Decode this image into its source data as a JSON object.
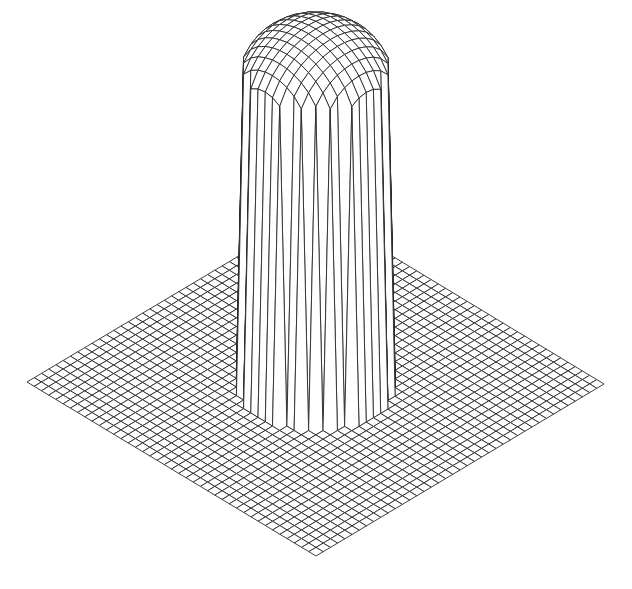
{
  "chart_data": {
    "type": "surface-wireframe",
    "title": "",
    "xlabel": "",
    "ylabel": "",
    "zlabel": "",
    "grid": {
      "nx": 40,
      "ny": 40,
      "x_range": [
        -1,
        1
      ],
      "y_range": [
        -1,
        1
      ]
    },
    "function": "z = base for r > R; z = height + dome*sqrt(1-(r/R)^2) for r <= R",
    "params": {
      "R": 0.38,
      "base": 0,
      "height": 1.0,
      "dome": 0.18
    },
    "projection": {
      "corner_left": [
        27,
        382
      ],
      "corner_right": [
        604,
        384
      ],
      "corner_back": [
        316,
        210
      ],
      "corner_front": [
        316,
        556
      ],
      "z_pixels_per_unit": 300
    },
    "style": {
      "line_color": "#2a2a2a",
      "background": "#ffffff",
      "line_width": 0.9
    }
  }
}
